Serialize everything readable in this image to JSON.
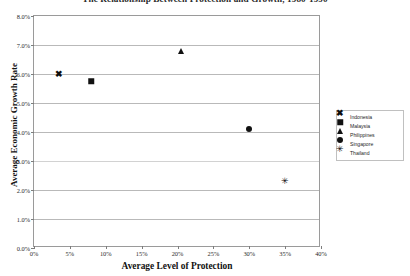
{
  "chart_data": {
    "type": "scatter",
    "title": "The Relationship Between Protection and Growth, 1980-1990",
    "xlabel": "Average Level of Protection",
    "ylabel": "Average Economic Growth Rate",
    "xlim": [
      0,
      40
    ],
    "ylim": [
      0,
      8
    ],
    "x_tick_labels": [
      "0%",
      "5%",
      "10%",
      "15%",
      "20%",
      "25%",
      "30%",
      "35%",
      "40%"
    ],
    "x_tick_values": [
      0,
      5,
      10,
      15,
      20,
      25,
      30,
      35,
      40
    ],
    "y_tick_labels": [
      "0.0%",
      "1.0%",
      "2.0%",
      "3.0%",
      "4.0%",
      "5.0%",
      "6.0%",
      "7.0%",
      "8.0%"
    ],
    "y_tick_values": [
      0,
      1,
      2,
      3,
      4,
      5,
      6,
      7,
      8
    ],
    "grid": "horizontal",
    "legend_position": "right",
    "series": [
      {
        "name": "Indonesia",
        "marker": "cross",
        "glyph": "✖",
        "x": 3.5,
        "y": 6.0
      },
      {
        "name": "Malaysia",
        "marker": "square",
        "glyph": "",
        "x": 8.0,
        "y": 5.75
      },
      {
        "name": "Philippines",
        "marker": "triangle",
        "glyph": "",
        "x": 20.5,
        "y": 6.8
      },
      {
        "name": "Singapore",
        "marker": "diamond",
        "glyph": "",
        "x": 30.0,
        "y": 4.1
      },
      {
        "name": "Thailand",
        "marker": "star",
        "glyph": "✳",
        "x": 35.0,
        "y": 2.3
      }
    ]
  },
  "legend": {
    "items": [
      {
        "label": "Indonesia"
      },
      {
        "label": "Malaysia"
      },
      {
        "label": "Philippines"
      },
      {
        "label": "Singapore"
      },
      {
        "label": "Thailand"
      }
    ]
  }
}
